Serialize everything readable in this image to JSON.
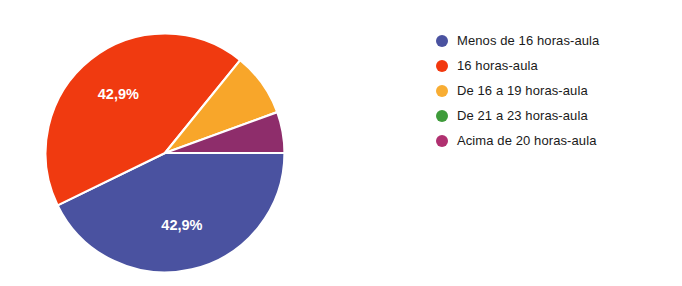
{
  "chart_data": {
    "type": "pie",
    "title": "",
    "categories": [
      "Menos de 16 horas-aula",
      "16 horas-aula",
      "De 16 a 19 horas-aula",
      "De 21 a 23 horas-aula",
      "Acima de 20 horas-aula"
    ],
    "values": [
      42.9,
      42.9,
      8.6,
      0.0,
      5.7
    ],
    "value_unit": "%",
    "colors": [
      "#4A52A0",
      "#F03A10",
      "#F8A62A",
      "#3E9B3A",
      "#8E2D6B"
    ],
    "legend_colors": [
      "#4A52A0",
      "#F2380E",
      "#F8AD33",
      "#3E9B3A",
      "#B03070"
    ],
    "legend_position": "right",
    "start_angle_deg": 90,
    "direction": "clockwise",
    "data_labels": [
      {
        "category_index": 0,
        "text": "42,9%"
      },
      {
        "category_index": 1,
        "text": "42,9%"
      }
    ],
    "xlabel": "",
    "ylabel": ""
  },
  "chart": {
    "slices": [
      {
        "name": "Menos de 16 horas-aula",
        "label": "42,9%",
        "color": "#4A52A0",
        "start": 90,
        "end": 244,
        "label_angle": 167,
        "label_radius": 0.63,
        "show_label": true
      },
      {
        "name": "16 horas-aula",
        "label": "42,9%",
        "color": "#F03A10",
        "start": 244,
        "end": 399,
        "label_angle": 321,
        "label_radius": 0.62,
        "show_label": true
      },
      {
        "name": "De 16 a 19 horas-aula",
        "label": "8,6%",
        "color": "#F8A62A",
        "start": 39,
        "end": 70,
        "label_angle": 54,
        "label_radius": 0.6,
        "show_label": false
      },
      {
        "name": "De 21 a 23 horas-aula",
        "label": "0%",
        "color": "#3E9B3A",
        "start": 70,
        "end": 70,
        "label_angle": 70,
        "label_radius": 0.6,
        "show_label": false
      },
      {
        "name": "Acima de 20 horas-aula",
        "label": "5,7%",
        "color": "#8E2D6B",
        "start": 70,
        "end": 90,
        "label_angle": 80,
        "label_radius": 0.6,
        "show_label": false
      }
    ],
    "geometry": {
      "cx": 125,
      "cy": 125,
      "r": 119.5
    },
    "separator_color": "#ffffff",
    "separator_width": 2.2
  },
  "legend": {
    "items": [
      {
        "label": "Menos de 16 horas-aula",
        "color": "#4A52A0",
        "icon": "legend-dot-icon"
      },
      {
        "label": "16 horas-aula",
        "color": "#F2380E",
        "icon": "legend-dot-icon"
      },
      {
        "label": "De 16 a 19 horas-aula",
        "color": "#F8AD33",
        "icon": "legend-dot-icon"
      },
      {
        "label": "De 21 a 23 horas-aula",
        "color": "#3E9B3A",
        "icon": "legend-dot-icon"
      },
      {
        "label": "Acima de 20 horas-aula",
        "color": "#B03070",
        "icon": "legend-dot-icon"
      }
    ]
  }
}
